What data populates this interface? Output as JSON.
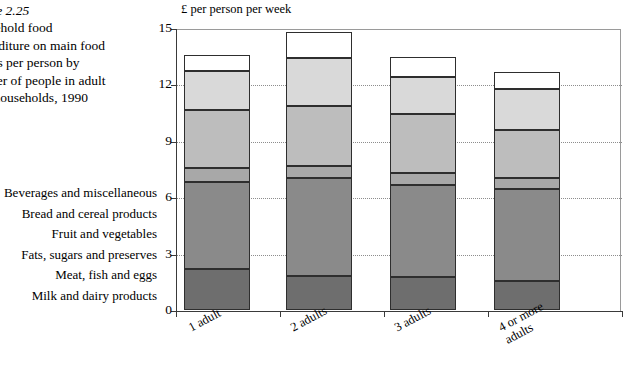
{
  "caption": {
    "figure_number": "Figure 2.25",
    "lines": [
      "Household food",
      "expenditure on main food",
      "groups per person by",
      "number of people in adult",
      "only households, 1990"
    ]
  },
  "legend": {
    "items": [
      {
        "label": "Beverages and miscellaneous",
        "color": "#ffffff"
      },
      {
        "label": "Bread and cereal products",
        "color": "#d9d9d9"
      },
      {
        "label": "Fruit and vegetables",
        "color": "#bdbdbd"
      },
      {
        "label": "Fats, sugars and preserves",
        "color": "#a8a8a8"
      },
      {
        "label": "Meat, fish and eggs",
        "color": "#8a8a8a"
      },
      {
        "label": "Milk and dairy products",
        "color": "#6e6e6e"
      }
    ]
  },
  "chart_data": {
    "type": "bar",
    "subtype": "stacked",
    "title": "",
    "ylabel": "£ per person per week",
    "xlabel": "",
    "ylim": [
      0,
      15
    ],
    "yticks": [
      0,
      3,
      6,
      9,
      12,
      15
    ],
    "grid": true,
    "legend_position": "left",
    "categories": [
      "1 adult",
      "2 adults",
      "3 adults",
      "4 or more\nadults"
    ],
    "series": [
      {
        "name": "Milk and dairy products",
        "color": "#6e6e6e",
        "values": [
          2.2,
          1.8,
          1.75,
          1.55
        ]
      },
      {
        "name": "Meat, fish and eggs",
        "color": "#8a8a8a",
        "values": [
          4.6,
          5.2,
          4.9,
          4.9
        ]
      },
      {
        "name": "Fats, sugars and preserves",
        "color": "#a8a8a8",
        "values": [
          0.75,
          0.65,
          0.65,
          0.55
        ]
      },
      {
        "name": "Fruit and vegetables",
        "color": "#bdbdbd",
        "values": [
          3.1,
          3.2,
          3.1,
          2.55
        ]
      },
      {
        "name": "Bread and cereal products",
        "color": "#d9d9d9",
        "values": [
          2.05,
          2.55,
          2.0,
          2.2
        ]
      },
      {
        "name": "Beverages and miscellaneous",
        "color": "#ffffff",
        "values": [
          0.85,
          1.4,
          1.05,
          0.9
        ]
      }
    ],
    "totals": [
      15.55,
      14.8,
      13.45,
      12.65
    ]
  }
}
